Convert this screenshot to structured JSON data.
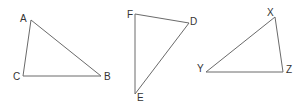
{
  "diagram": {
    "type": "geometry-triangles",
    "stroke_color": "#6a6a6a",
    "label_color": "#333333",
    "triangles": [
      {
        "name": "ABC",
        "vertices": [
          {
            "label": "A",
            "x": 31,
            "y": 20,
            "lx": 20,
            "ly": 22
          },
          {
            "label": "B",
            "x": 101,
            "y": 76,
            "lx": 104,
            "ly": 80
          },
          {
            "label": "C",
            "x": 23,
            "y": 76,
            "lx": 13,
            "ly": 80
          }
        ]
      },
      {
        "name": "DEF",
        "vertices": [
          {
            "label": "D",
            "x": 189,
            "y": 23,
            "lx": 190,
            "ly": 25
          },
          {
            "label": "E",
            "x": 135,
            "y": 94,
            "lx": 137,
            "ly": 101
          },
          {
            "label": "F",
            "x": 135,
            "y": 14,
            "lx": 127,
            "ly": 18
          }
        ]
      },
      {
        "name": "XYZ",
        "vertices": [
          {
            "label": "X",
            "x": 275,
            "y": 17,
            "lx": 267,
            "ly": 16
          },
          {
            "label": "Y",
            "x": 206,
            "y": 72,
            "lx": 197,
            "ly": 72
          },
          {
            "label": "Z",
            "x": 283,
            "y": 72,
            "lx": 286,
            "ly": 73
          }
        ]
      }
    ]
  }
}
